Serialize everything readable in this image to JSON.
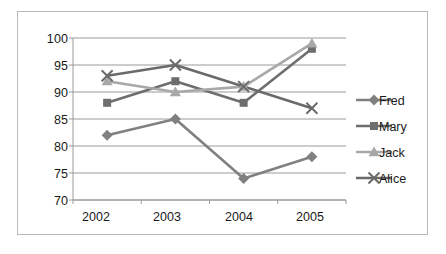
{
  "chart_data": {
    "type": "line",
    "title": "",
    "xlabel": "",
    "ylabel": "",
    "categories": [
      "2002",
      "2003",
      "2004",
      "2005"
    ],
    "ylim": [
      70,
      100
    ],
    "yticks": [
      70,
      75,
      80,
      85,
      90,
      95,
      100
    ],
    "grid": true,
    "legend_position": "right",
    "series": [
      {
        "name": "Fred",
        "values": [
          82,
          85,
          74,
          78
        ],
        "marker": "diamond",
        "color": "#808080"
      },
      {
        "name": "Mary",
        "values": [
          88,
          92,
          88,
          98
        ],
        "marker": "square",
        "color": "#6e6e6e"
      },
      {
        "name": "Jack",
        "values": [
          92,
          90,
          91,
          99
        ],
        "marker": "triangle",
        "color": "#a8a8a8"
      },
      {
        "name": "Alice",
        "values": [
          93,
          95,
          91,
          87
        ],
        "marker": "cross",
        "color": "#6a6a6a"
      }
    ]
  },
  "axes": {
    "y_tick_labels": [
      "100",
      "95",
      "90",
      "85",
      "80",
      "75",
      "70"
    ],
    "x_tick_labels": [
      "2002",
      "2003",
      "2004",
      "2005"
    ]
  },
  "legend": {
    "entries": [
      {
        "label": "Fred"
      },
      {
        "label": "Mary"
      },
      {
        "label": "Jack"
      },
      {
        "label": "Alice"
      }
    ]
  },
  "colors": {
    "fred": "#808080",
    "mary": "#6e6e6e",
    "jack": "#a8a8a8",
    "alice": "#6a6a6a",
    "grid": "#9a9a9a",
    "axis": "#9a9a9a",
    "border": "#b9b9b9"
  }
}
